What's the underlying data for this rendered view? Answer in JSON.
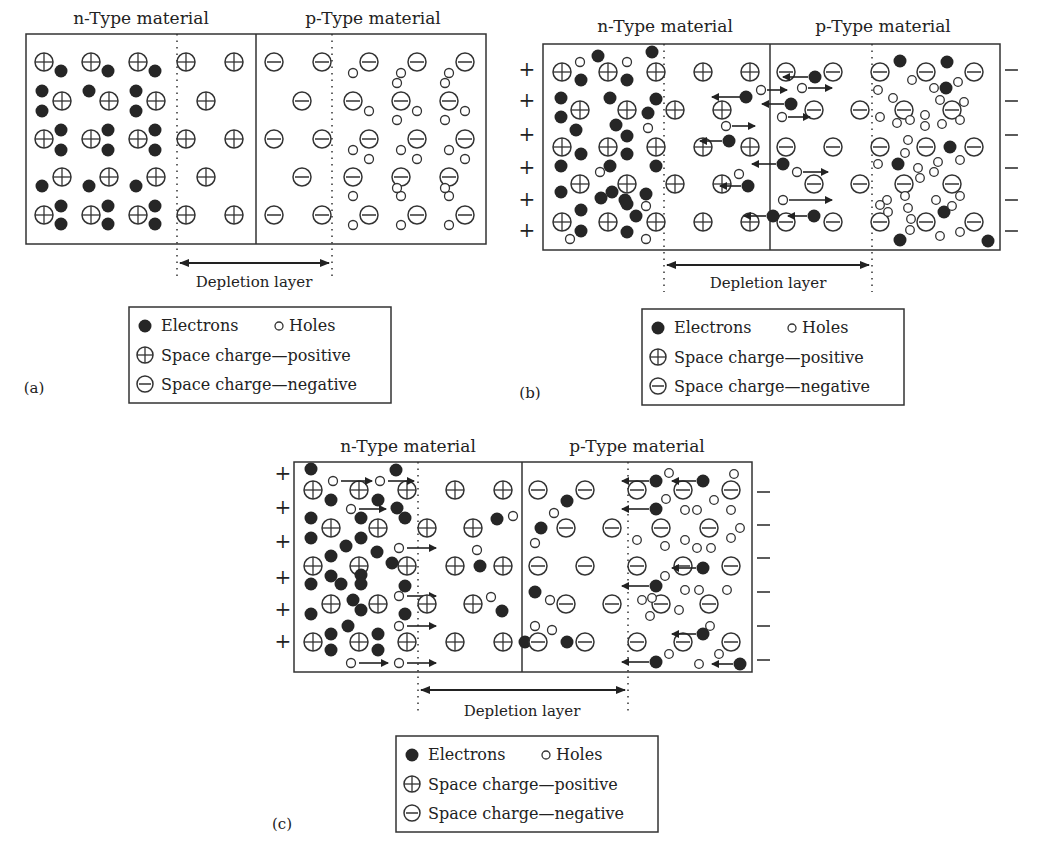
{
  "legend": {
    "electrons": "Electrons",
    "holes": "Holes",
    "positive": "Space charge—positive",
    "negative": "Space charge—negative"
  },
  "panels": [
    {
      "id": "a",
      "caption": "(a)",
      "n_label": "n-Type material",
      "p_label": "p-Type material",
      "depletion_label": "Depletion layer",
      "box": {
        "x": 26,
        "y": 34,
        "w": 460,
        "h": 210
      },
      "junction_x": 256,
      "dep_left": 177,
      "dep_right": 332,
      "terminals": false
    },
    {
      "id": "b",
      "caption": "(b)",
      "n_label": "n-Type material",
      "p_label": "p-Type material",
      "depletion_label": "Depletion layer",
      "box": {
        "x": 543,
        "y": 44,
        "w": 457,
        "h": 206
      },
      "junction_x": 770,
      "dep_left": 664,
      "dep_right": 872,
      "terminals": true,
      "left_terminal": "+",
      "right_terminal": "—"
    },
    {
      "id": "c",
      "caption": "(c)",
      "n_label": "n-Type material",
      "p_label": "p-Type material",
      "depletion_label": "Depletion layer",
      "box": {
        "x": 294,
        "y": 462,
        "w": 458,
        "h": 210
      },
      "junction_x": 522,
      "dep_left": 418,
      "dep_right": 628,
      "terminals": true,
      "left_terminal": "+",
      "right_terminal": "—"
    }
  ]
}
